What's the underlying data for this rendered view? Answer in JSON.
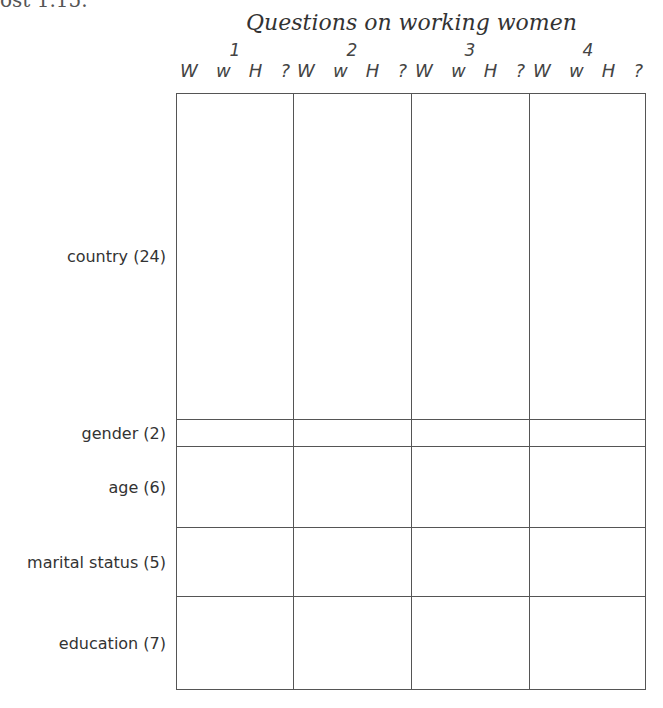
{
  "clipped_text": "ost 1.15.",
  "title": "Questions on working women",
  "questions": [
    "1",
    "2",
    "3",
    "4"
  ],
  "answer_codes": [
    "W",
    "w",
    "H",
    "?"
  ],
  "rows": [
    {
      "label": "country (24)",
      "categories": 24
    },
    {
      "label": "gender (2)",
      "categories": 2
    },
    {
      "label": "age (6)",
      "categories": 6
    },
    {
      "label": "marital status (5)",
      "categories": 5
    },
    {
      "label": "education (7)",
      "categories": 7
    }
  ]
}
